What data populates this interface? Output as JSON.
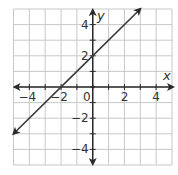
{
  "chart_data": {
    "type": "line",
    "title": "",
    "xlabel": "x",
    "ylabel": "y",
    "xlim": [
      -5,
      5
    ],
    "ylim": [
      -5,
      5
    ],
    "grid": true,
    "grid_step": 1,
    "x_ticks": [
      -4,
      -2,
      0,
      2,
      4
    ],
    "y_ticks": [
      4,
      2,
      -2,
      -4
    ],
    "x_tick_labels": [
      "−4",
      "−2",
      "0",
      "2",
      "4"
    ],
    "y_tick_labels": [
      "4",
      "2",
      "−2",
      "−4"
    ],
    "origin_label": "0",
    "series": [
      {
        "name": "y = x + 2",
        "equation": "y = x + 2",
        "x": [
          -5,
          3
        ],
        "y": [
          -3,
          5
        ],
        "arrows": "both"
      }
    ],
    "legend": "none"
  },
  "colors": {
    "grid": "#c8c8c8",
    "axis": "#2a2a2a",
    "line": "#3a3a3a",
    "text": "#333333",
    "background": "#ffffff"
  }
}
